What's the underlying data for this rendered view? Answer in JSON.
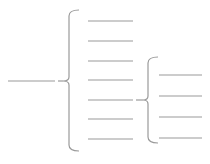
{
  "diagram": {
    "type": "brace-tree",
    "stroke_color": "#9a9a9a",
    "root": {
      "line": {
        "x1": 8,
        "x2": 55,
        "y": 81
      }
    },
    "level1": {
      "brace": {
        "x": 69,
        "top": 10,
        "bottom": 151,
        "mid": 81
      },
      "items": [
        {
          "y": 21,
          "label": ""
        },
        {
          "y": 41,
          "label": ""
        },
        {
          "y": 61,
          "label": ""
        },
        {
          "y": 80,
          "label": ""
        },
        {
          "y": 100,
          "label": ""
        },
        {
          "y": 119,
          "label": ""
        },
        {
          "y": 139,
          "label": ""
        }
      ],
      "item_x1": 88,
      "item_x2": 133
    },
    "level2": {
      "parent_index": 4,
      "brace": {
        "x": 148,
        "top": 57,
        "bottom": 143,
        "mid": 100
      },
      "items": [
        {
          "y": 75,
          "label": ""
        },
        {
          "y": 96,
          "label": ""
        },
        {
          "y": 117,
          "label": ""
        },
        {
          "y": 138,
          "label": ""
        }
      ],
      "item_x1": 159,
      "item_x2": 202
    }
  }
}
